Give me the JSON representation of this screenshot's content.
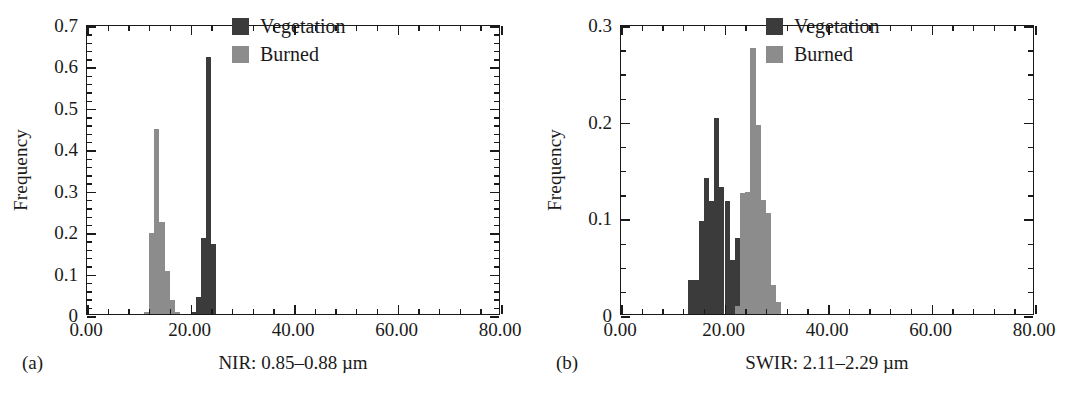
{
  "figure": {
    "panels": [
      {
        "tag": "(a)",
        "xaxis_title": "NIR: 0.85–0.88 µm",
        "ylabel": "Frequency"
      },
      {
        "tag": "(b)",
        "xaxis_title": "SWIR: 2.11–2.29 µm",
        "ylabel": "Frequency"
      }
    ],
    "legend": {
      "position": "top-right",
      "entries": [
        {
          "label": "Vegetation",
          "color": "#3b3b3b",
          "key": "veg"
        },
        {
          "label": "Burned",
          "color": "#8c8c8c",
          "key": "burn"
        }
      ]
    }
  },
  "colors": {
    "vegetation": "#3b3b3b",
    "burned": "#8c8c8c",
    "axis": "#1a1a1a",
    "background": "#ffffff"
  },
  "chart_data": [
    {
      "id": "panel-a",
      "type": "bar",
      "subtype": "histogram",
      "title": "",
      "panel_tag": "(a)",
      "xlabel": "NIR: 0.85–0.88 µm",
      "ylabel": "Frequency",
      "xlim": [
        0,
        80
      ],
      "ylim": [
        0,
        0.7
      ],
      "xticks": [
        0,
        20,
        40,
        60,
        80
      ],
      "xtick_labels": [
        "0.00",
        "20.00",
        "40.00",
        "60.00",
        "80.00"
      ],
      "x_minor_tick_step": 4,
      "yticks": [
        0,
        0.1,
        0.2,
        0.3,
        0.4,
        0.5,
        0.6,
        0.7
      ],
      "ytick_labels": [
        "0",
        "0.1",
        "0.2",
        "0.3",
        "0.4",
        "0.5",
        "0.6",
        "0.7"
      ],
      "y_minor_tick_step": 0.02,
      "grid": false,
      "legend_position": "upper right",
      "bin_width": 1,
      "series": [
        {
          "name": "Burned",
          "color": "#8c8c8c",
          "bins": [
            11,
            12,
            13,
            14,
            15,
            16,
            17
          ],
          "values": [
            0.005,
            0.195,
            0.447,
            0.222,
            0.105,
            0.033,
            0.004
          ]
        },
        {
          "name": "Vegetation",
          "color": "#3b3b3b",
          "bins": [
            20,
            21,
            22,
            23,
            24
          ],
          "values": [
            0.006,
            0.04,
            0.183,
            0.621,
            0.168
          ]
        }
      ]
    },
    {
      "id": "panel-b",
      "type": "bar",
      "subtype": "histogram",
      "title": "",
      "panel_tag": "(b)",
      "xlabel": "SWIR: 2.11–2.29 µm",
      "ylabel": "Frequency",
      "xlim": [
        0,
        80
      ],
      "ylim": [
        0,
        0.3
      ],
      "xticks": [
        0,
        20,
        40,
        60,
        80
      ],
      "xtick_labels": [
        "0.00",
        "20.00",
        "40.00",
        "60.00",
        "80.00"
      ],
      "x_minor_tick_step": 4,
      "yticks": [
        0,
        0.1,
        0.2,
        0.3
      ],
      "ytick_labels": [
        "0",
        "0.1",
        "0.2",
        "0.3"
      ],
      "y_minor_tick_step": 0.025,
      "grid": false,
      "legend_position": "upper right",
      "bin_width": 1,
      "series": [
        {
          "name": "Vegetation",
          "color": "#3b3b3b",
          "bins": [
            13,
            14,
            15,
            16,
            17,
            18,
            19,
            20,
            21,
            22
          ],
          "values": [
            0.035,
            0.035,
            0.096,
            0.141,
            0.117,
            0.203,
            0.131,
            0.117,
            0.056,
            0.079
          ]
        },
        {
          "name": "Burned",
          "color": "#8c8c8c",
          "bins": [
            22,
            23,
            24,
            25,
            26,
            27,
            28,
            29,
            30
          ],
          "values": [
            0.008,
            0.125,
            0.126,
            0.275,
            0.196,
            0.118,
            0.104,
            0.03,
            0.012
          ]
        }
      ]
    }
  ]
}
